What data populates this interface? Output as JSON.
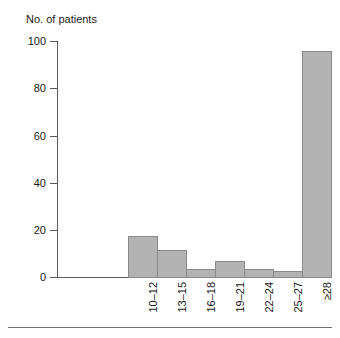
{
  "chart_data": {
    "type": "bar",
    "title": "",
    "xlabel": "",
    "ylabel": "No. of patients",
    "categories": [
      "10–12",
      "13–15",
      "16–18",
      "19–21",
      "22–24",
      "25–27",
      "≥28"
    ],
    "values": [
      18,
      12,
      4,
      7,
      4,
      3,
      96
    ],
    "ylim": [
      0,
      100
    ],
    "y_ticks": [
      0,
      20,
      40,
      60,
      80,
      100
    ],
    "y_tick_labels": [
      "0",
      "20",
      "40",
      "60",
      "80",
      "100"
    ],
    "grid": false,
    "legend": null,
    "bar_color": "#b3b3b3",
    "bar_border_color": "#8a8a8a",
    "axis_color": "#5a5a5a"
  },
  "axes": {
    "y_title": "No. of patients"
  },
  "footer": {
    "rule_color": "#6e6e6e"
  }
}
